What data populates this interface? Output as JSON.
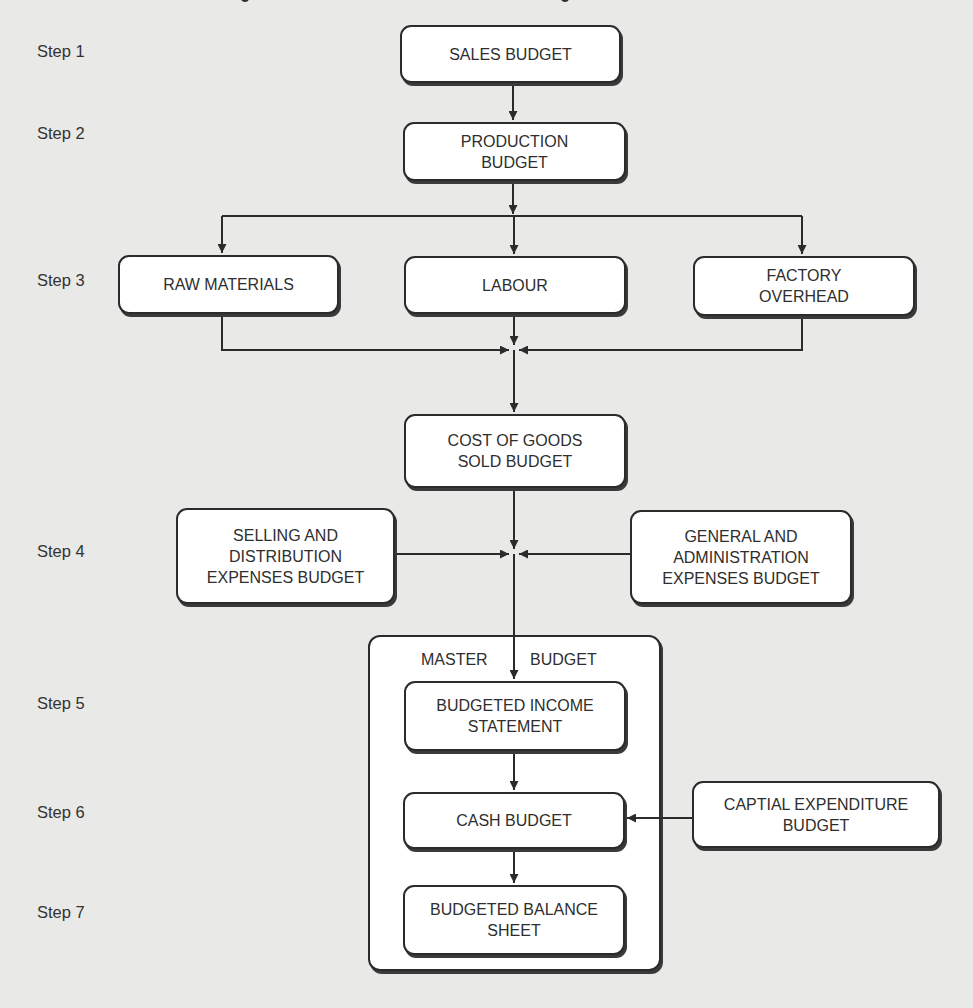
{
  "diagram": {
    "title_partially_visible": true,
    "colors": {
      "background": "#e9e9e7",
      "box_fill": "#ffffff",
      "box_border": "#2b2b2b",
      "text": "#2e2e2e",
      "arrow": "#2b2b2b"
    },
    "steps": [
      {
        "label": "Step 1"
      },
      {
        "label": "Step 2"
      },
      {
        "label": "Step 3"
      },
      {
        "label": "Step 4"
      },
      {
        "label": "Step 5"
      },
      {
        "label": "Step 6"
      },
      {
        "label": "Step 7"
      }
    ],
    "nodes": {
      "sales": {
        "label": "SALES BUDGET",
        "step": 1
      },
      "production": {
        "label": "PRODUCTION\nBUDGET",
        "step": 2
      },
      "raw_materials": {
        "label": "RAW MATERIALS",
        "step": 3
      },
      "labour": {
        "label": "LABOUR",
        "step": 3
      },
      "factory_overhead": {
        "label": "FACTORY\nOVERHEAD",
        "step": 3
      },
      "cogs": {
        "label": "COST OF GOODS\nSOLD BUDGET",
        "step": 3
      },
      "selling_distribution": {
        "label": "SELLING AND\nDISTRIBUTION\nEXPENSES BUDGET",
        "step": 4
      },
      "general_admin": {
        "label": "GENERAL AND\nADMINISTRATION\nEXPENSES BUDGET",
        "step": 4
      },
      "income_statement": {
        "label": "BUDGETED INCOME\nSTATEMENT",
        "step": 5
      },
      "cash_budget": {
        "label": "CASH BUDGET",
        "step": 6
      },
      "capital_expenditure": {
        "label": "CAPTIAL EXPENDITURE\nBUDGET",
        "step": 6
      },
      "balance_sheet": {
        "label": "BUDGETED BALANCE\nSHEET",
        "step": 7
      }
    },
    "master_budget": {
      "title_left": "MASTER",
      "title_right": "BUDGET",
      "contains": [
        "income_statement",
        "cash_budget",
        "balance_sheet"
      ]
    },
    "edges": [
      {
        "from": "sales",
        "to": "production"
      },
      {
        "from": "production",
        "to": "raw_materials"
      },
      {
        "from": "production",
        "to": "labour"
      },
      {
        "from": "production",
        "to": "factory_overhead"
      },
      {
        "from": "raw_materials",
        "to": "cogs"
      },
      {
        "from": "labour",
        "to": "cogs"
      },
      {
        "from": "factory_overhead",
        "to": "cogs"
      },
      {
        "from": "cogs",
        "to": "income_statement"
      },
      {
        "from": "selling_distribution",
        "to": "income_statement"
      },
      {
        "from": "general_admin",
        "to": "income_statement"
      },
      {
        "from": "income_statement",
        "to": "cash_budget"
      },
      {
        "from": "capital_expenditure",
        "to": "cash_budget"
      },
      {
        "from": "cash_budget",
        "to": "balance_sheet"
      }
    ]
  }
}
